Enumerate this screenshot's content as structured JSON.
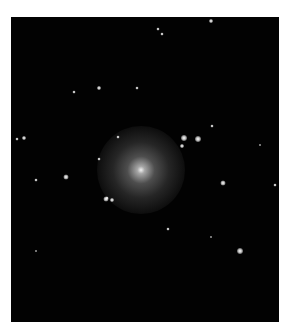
{
  "image": {
    "description": "Astronomical photograph of an elliptical galaxy with surrounding field stars on a black background",
    "background_color": "#020202",
    "border_color": "#ffffff"
  },
  "galaxy": {
    "cx": 130,
    "cy": 153,
    "radius": 44
  },
  "stars": [
    {
      "x": 200,
      "y": 4,
      "s": 4
    },
    {
      "x": 147,
      "y": 12,
      "s": 3
    },
    {
      "x": 151,
      "y": 17,
      "s": 3
    },
    {
      "x": 88,
      "y": 71,
      "s": 4
    },
    {
      "x": 126,
      "y": 71,
      "s": 3
    },
    {
      "x": 6,
      "y": 122,
      "s": 3
    },
    {
      "x": 13,
      "y": 121,
      "s": 4
    },
    {
      "x": 107,
      "y": 120,
      "s": 3
    },
    {
      "x": 173,
      "y": 121,
      "s": 6
    },
    {
      "x": 187,
      "y": 122,
      "s": 6
    },
    {
      "x": 171,
      "y": 129,
      "s": 4
    },
    {
      "x": 201,
      "y": 109,
      "s": 3
    },
    {
      "x": 88,
      "y": 142,
      "s": 3
    },
    {
      "x": 55,
      "y": 160,
      "s": 5
    },
    {
      "x": 25,
      "y": 163,
      "s": 3
    },
    {
      "x": 212,
      "y": 166,
      "s": 5
    },
    {
      "x": 264,
      "y": 168,
      "s": 3
    },
    {
      "x": 96,
      "y": 181,
      "s": 3
    },
    {
      "x": 95,
      "y": 182,
      "s": 5
    },
    {
      "x": 101,
      "y": 183,
      "s": 4
    },
    {
      "x": 157,
      "y": 212,
      "s": 3
    },
    {
      "x": 229,
      "y": 234,
      "s": 6
    },
    {
      "x": 249,
      "y": 128,
      "s": 2
    },
    {
      "x": 63,
      "y": 75,
      "s": 3
    },
    {
      "x": 200,
      "y": 220,
      "s": 2
    },
    {
      "x": 25,
      "y": 234,
      "s": 2
    }
  ]
}
